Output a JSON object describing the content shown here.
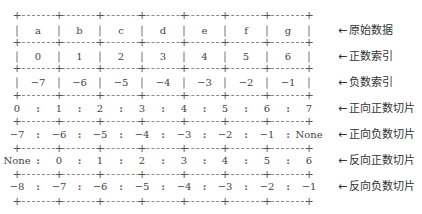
{
  "diagram": {
    "rows": [
      {
        "kind": "cells",
        "values": [
          "a",
          "b",
          "c",
          "d",
          "e",
          "f",
          "g"
        ],
        "label": "原始数据"
      },
      {
        "kind": "cells",
        "values": [
          "0",
          "1",
          "2",
          "3",
          "4",
          "5",
          "6"
        ],
        "label": "正数索引"
      },
      {
        "kind": "cells",
        "values": [
          "−7",
          "−6",
          "−5",
          "−4",
          "−3",
          "−2",
          "−1"
        ],
        "label": "负数索引"
      },
      {
        "kind": "slice",
        "values": [
          "0",
          "1",
          "2",
          "3",
          "4",
          "5",
          "6",
          "7"
        ],
        "label": "正向正数切片"
      },
      {
        "kind": "slice",
        "values": [
          "−7",
          "−6",
          "−5",
          "−4",
          "−3",
          "−2",
          "−1",
          "None"
        ],
        "label": "正向负数切片"
      },
      {
        "kind": "slice",
        "values": [
          "None",
          "0",
          "1",
          "2",
          "3",
          "4",
          "5",
          "6"
        ],
        "label": "反向正数切片"
      },
      {
        "kind": "slice",
        "values": [
          "−8",
          "−7",
          "−6",
          "−5",
          "−4",
          "−3",
          "−2",
          "−1"
        ],
        "label": "反向负数切片"
      }
    ],
    "arrow_glyph": "←"
  }
}
